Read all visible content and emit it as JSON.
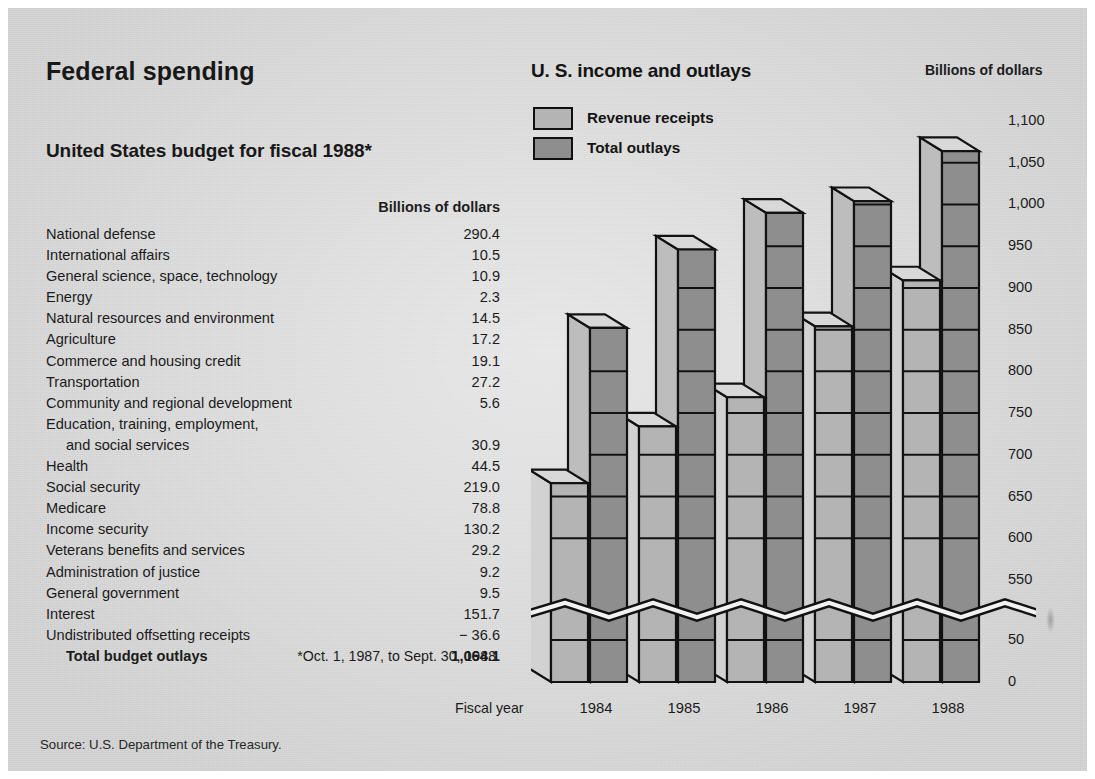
{
  "section": {
    "title": "Federal spending",
    "source": "Source: U.S. Department of the Treasury."
  },
  "budget_table": {
    "title": "United States budget for fiscal 1988*",
    "unit_header": "Billions of dollars",
    "footnote": "*Oct. 1, 1987, to Sept. 30, 1988.",
    "rows": [
      {
        "label": "National defense",
        "value": "290.4"
      },
      {
        "label": "International affairs",
        "value": "10.5"
      },
      {
        "label": "General science, space, technology",
        "value": "10.9"
      },
      {
        "label": "Energy",
        "value": "2.3"
      },
      {
        "label": "Natural resources and environment",
        "value": "14.5"
      },
      {
        "label": "Agriculture",
        "value": "17.2"
      },
      {
        "label": "Commerce and housing credit",
        "value": "19.1"
      },
      {
        "label": "Transportation",
        "value": "27.2"
      },
      {
        "label": "Community and regional development",
        "value": "5.6"
      },
      {
        "label": "Education, training, employment,",
        "value": ""
      },
      {
        "label": "and social services",
        "value": "30.9",
        "indent": true
      },
      {
        "label": "Health",
        "value": "44.5"
      },
      {
        "label": "Social security",
        "value": "219.0"
      },
      {
        "label": "Medicare",
        "value": "78.8"
      },
      {
        "label": "Income security",
        "value": "130.2"
      },
      {
        "label": "Veterans benefits and services",
        "value": "29.2"
      },
      {
        "label": "Administration of justice",
        "value": "9.2"
      },
      {
        "label": "General government",
        "value": "9.5"
      },
      {
        "label": "Interest",
        "value": "151.7"
      },
      {
        "label": "Undistributed offsetting receipts",
        "value": "− 36.6"
      },
      {
        "label": "Total budget outlays",
        "value": "1,064.1",
        "total": true
      }
    ]
  },
  "chart_data": {
    "type": "bar",
    "title": "U. S. income and outlays",
    "ylabel": "Billions of dollars",
    "xlabel": "Fiscal year",
    "categories": [
      "1984",
      "1985",
      "1986",
      "1987",
      "1988"
    ],
    "series": [
      {
        "name": "Revenue receipts",
        "color": "#b4b4b4",
        "values": [
          666,
          734,
          769,
          854,
          909
        ]
      },
      {
        "name": "Total outlays",
        "color": "#8e8e8e",
        "values": [
          852,
          946,
          990,
          1004,
          1064
        ]
      }
    ],
    "yticks": [
      "1,100",
      "1,050",
      "1,000",
      "950",
      "900",
      "850",
      "800",
      "750",
      "700",
      "650",
      "600",
      "550",
      "50",
      "0"
    ],
    "ylim": [
      0,
      1100
    ],
    "axis_break": {
      "between": [
        "550",
        "50"
      ],
      "style": "zigzag"
    },
    "grid": true,
    "legend_position": "top-left",
    "style": "3d-columns"
  }
}
